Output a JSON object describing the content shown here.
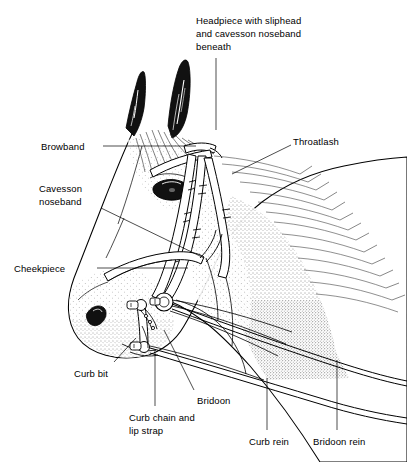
{
  "figure": {
    "background_color": "#ffffff",
    "ink_color": "#000000",
    "width": 407,
    "height": 462
  },
  "labels": {
    "headpiece": {
      "text": "Headpiece with sliphead\nand cavesson noseband\nbeneath",
      "x": 196,
      "y": 14
    },
    "browband": {
      "text": "Browband",
      "x": 41,
      "y": 140
    },
    "throatlash": {
      "text": "Throatlash",
      "x": 293,
      "y": 135
    },
    "cavesson_noseband": {
      "text": "Cavesson\nnoseband",
      "x": 39,
      "y": 182
    },
    "cheekpiece": {
      "text": "Cheekpiece",
      "x": 14,
      "y": 262
    },
    "curb_bit": {
      "text": "Curb bit",
      "x": 74,
      "y": 367
    },
    "bridoon": {
      "text": "Bridoon",
      "x": 197,
      "y": 394
    },
    "curb_chain": {
      "text": "Curb chain and\nlip strap",
      "x": 129,
      "y": 411
    },
    "curb_rein": {
      "text": "Curb rein",
      "x": 249,
      "y": 435
    },
    "bridoon_rein": {
      "text": "Bridoon rein",
      "x": 313,
      "y": 435
    }
  },
  "parts_list": [
    "Headpiece with sliphead and cavesson noseband beneath",
    "Browband",
    "Throatlash",
    "Cavesson noseband",
    "Cheekpiece",
    "Curb bit",
    "Bridoon",
    "Curb chain and lip strap",
    "Curb rein",
    "Bridoon rein"
  ]
}
